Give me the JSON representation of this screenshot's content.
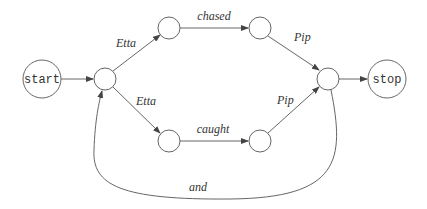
{
  "diagram": {
    "type": "finite-state-automaton",
    "nodes": [
      {
        "id": "start",
        "label": "start",
        "cx": 42,
        "cy": 79,
        "r": 19
      },
      {
        "id": "n1",
        "label": "",
        "cx": 105,
        "cy": 79,
        "r": 11
      },
      {
        "id": "n2",
        "label": "",
        "cx": 169,
        "cy": 28,
        "r": 11
      },
      {
        "id": "n3",
        "label": "",
        "cx": 260,
        "cy": 28,
        "r": 11
      },
      {
        "id": "n4",
        "label": "",
        "cx": 169,
        "cy": 141,
        "r": 11
      },
      {
        "id": "n5",
        "label": "",
        "cx": 260,
        "cy": 141,
        "r": 11
      },
      {
        "id": "n6",
        "label": "",
        "cx": 328,
        "cy": 79,
        "r": 11
      },
      {
        "id": "stop",
        "label": "stop",
        "cx": 387,
        "cy": 79,
        "r": 19
      }
    ],
    "edges": [
      {
        "from": "start",
        "to": "n1",
        "label": ""
      },
      {
        "from": "n1",
        "to": "n2",
        "label": "Etta"
      },
      {
        "from": "n1",
        "to": "n4",
        "label": "Etta"
      },
      {
        "from": "n2",
        "to": "n3",
        "label": "chased"
      },
      {
        "from": "n4",
        "to": "n5",
        "label": "caught"
      },
      {
        "from": "n3",
        "to": "n6",
        "label": "Pip"
      },
      {
        "from": "n5",
        "to": "n6",
        "label": "Pip"
      },
      {
        "from": "n6",
        "to": "stop",
        "label": ""
      },
      {
        "from": "n6",
        "to": "n1",
        "label": "and"
      }
    ],
    "labels": {
      "start": "start",
      "stop": "stop",
      "etta_top": "Etta",
      "etta_bottom": "Etta",
      "chased": "chased",
      "caught": "caught",
      "pip_top": "Pip",
      "pip_bottom": "Pip",
      "and": "and"
    }
  }
}
